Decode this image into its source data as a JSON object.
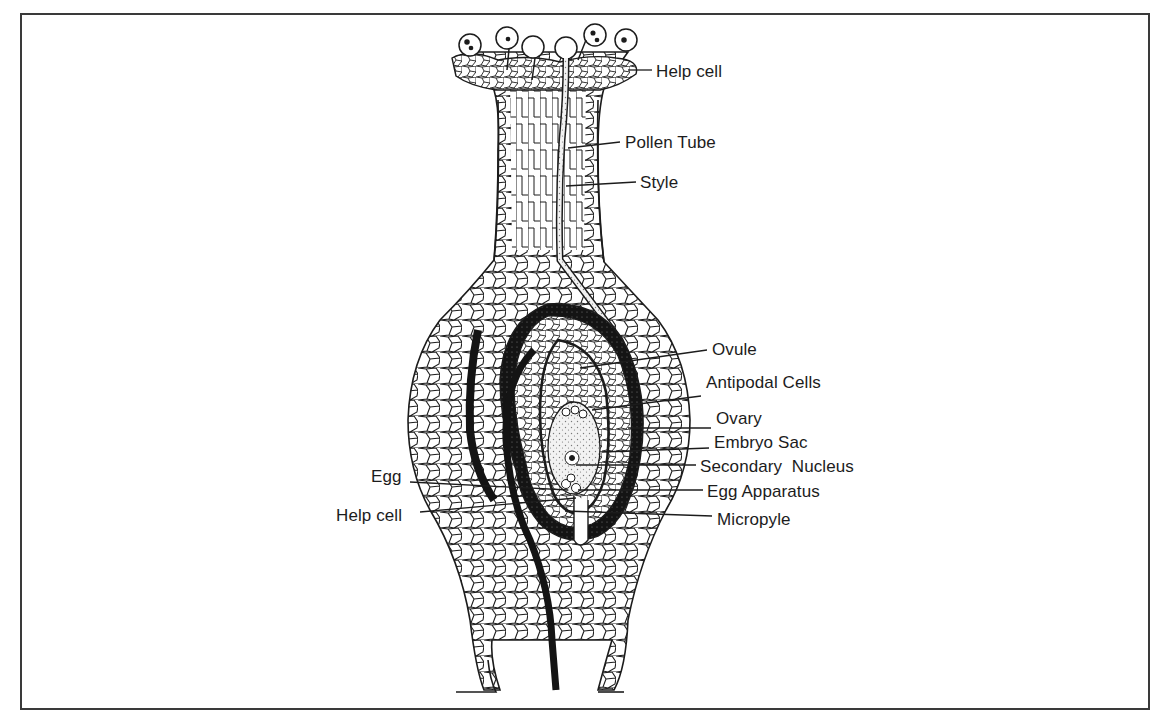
{
  "figure": {
    "colors": {
      "ink": "#1c1c1c",
      "frame": "#3a3a3a",
      "background": "#ffffff",
      "cell_fill": "#ffffff",
      "dark_tissue": "#141414",
      "stipple": "#7a7a7a"
    }
  },
  "labels": {
    "help_cell_top": {
      "text": "Help cell",
      "x": 656,
      "y": 63,
      "line": [
        [
          628,
          70
        ],
        [
          652,
          70
        ]
      ]
    },
    "pollen_tube": {
      "text": "Pollen Tube",
      "x": 625,
      "y": 134,
      "line": [
        [
          568,
          148
        ],
        [
          620,
          142
        ]
      ]
    },
    "style": {
      "text": "Style",
      "x": 640,
      "y": 174,
      "line": [
        [
          566,
          186
        ],
        [
          636,
          182
        ]
      ]
    },
    "ovule": {
      "text": "Ovule",
      "x": 712,
      "y": 341,
      "line": [
        [
          580,
          368
        ],
        [
          707,
          350
        ]
      ]
    },
    "antipodal_cells": {
      "text": "Antipodal Cells",
      "x": 706,
      "y": 374,
      "line": [
        [
          592,
          410
        ],
        [
          701,
          396
        ]
      ]
    },
    "ovary": {
      "text": "Ovary",
      "x": 716,
      "y": 410,
      "line": [
        [
          628,
          428
        ],
        [
          711,
          428
        ]
      ]
    },
    "embryo_sac": {
      "text": "Embryo Sac",
      "x": 714,
      "y": 434,
      "line": [
        [
          602,
          452
        ],
        [
          709,
          448
        ]
      ]
    },
    "secondary_nucleus": {
      "text": "Secondary  Nucleus",
      "x": 700,
      "y": 458,
      "line": [
        [
          576,
          465
        ],
        [
          696,
          465
        ]
      ]
    },
    "egg_apparatus": {
      "text": "Egg Apparatus",
      "x": 707,
      "y": 483,
      "line": [
        [
          578,
          490
        ],
        [
          703,
          490
        ]
      ]
    },
    "micropyle": {
      "text": "Micropyle",
      "x": 717,
      "y": 511,
      "line": [
        [
          565,
          511
        ],
        [
          712,
          516
        ]
      ]
    },
    "egg": {
      "text": "Egg",
      "x": 371,
      "y": 468,
      "line": [
        [
          410,
          482
        ],
        [
          568,
          490
        ]
      ]
    },
    "help_cell_bottom": {
      "text": "Help cell",
      "x": 336,
      "y": 507,
      "line": [
        [
          420,
          512
        ],
        [
          576,
          498
        ]
      ]
    }
  }
}
